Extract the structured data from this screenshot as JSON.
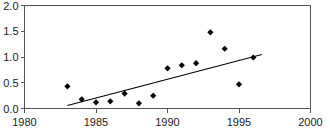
{
  "chart_data": {
    "type": "scatter",
    "title": "",
    "xlabel": "",
    "ylabel": "",
    "xlim": [
      1980,
      2000
    ],
    "ylim": [
      0.0,
      2.0
    ],
    "grid": false,
    "legend": null,
    "x_ticks": [
      1980,
      1985,
      1990,
      1995,
      2000
    ],
    "x_tick_labels": [
      "1980",
      "1985",
      "1990",
      "1995",
      "2000"
    ],
    "y_ticks": [
      0.0,
      0.5,
      1.0,
      1.5,
      2.0
    ],
    "y_tick_labels": [
      "0.0",
      "0.5",
      "1.0",
      "1.5",
      "2.0"
    ],
    "marker": "diamond",
    "marker_color": "#000000",
    "points": [
      {
        "x": 1983,
        "y": 0.43
      },
      {
        "x": 1984,
        "y": 0.18
      },
      {
        "x": 1985,
        "y": 0.12
      },
      {
        "x": 1986,
        "y": 0.14
      },
      {
        "x": 1987,
        "y": 0.29
      },
      {
        "x": 1988,
        "y": 0.1
      },
      {
        "x": 1989,
        "y": 0.25
      },
      {
        "x": 1990,
        "y": 0.78
      },
      {
        "x": 1991,
        "y": 0.84
      },
      {
        "x": 1992,
        "y": 0.88
      },
      {
        "x": 1993,
        "y": 1.48
      },
      {
        "x": 1994,
        "y": 1.16
      },
      {
        "x": 1995,
        "y": 0.47
      },
      {
        "x": 1996,
        "y": 0.99
      }
    ],
    "trend_line": {
      "x_start": 1983.0,
      "y_start": 0.06,
      "x_end": 1996.6,
      "y_end": 1.05,
      "color": "#000000"
    }
  }
}
